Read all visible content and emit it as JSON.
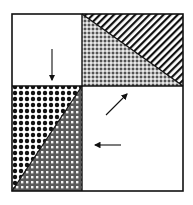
{
  "diagram": {
    "quadrants": [
      {
        "position": "top-left",
        "fill": "white",
        "arrow": "down"
      },
      {
        "position": "top-right",
        "fill": "two triangles: diagonal stripes (upper) and speckled dots (lower)"
      },
      {
        "position": "bottom-left",
        "fill": "two triangles: black dot grid (upper-left) and gray checker grid (lower-right)"
      },
      {
        "position": "bottom-right",
        "fill": "white",
        "arrows": [
          "up-right",
          "left"
        ]
      }
    ],
    "colors": {
      "stroke": "#111111",
      "background": "#ffffff",
      "gray": "#6e6e6e"
    }
  }
}
